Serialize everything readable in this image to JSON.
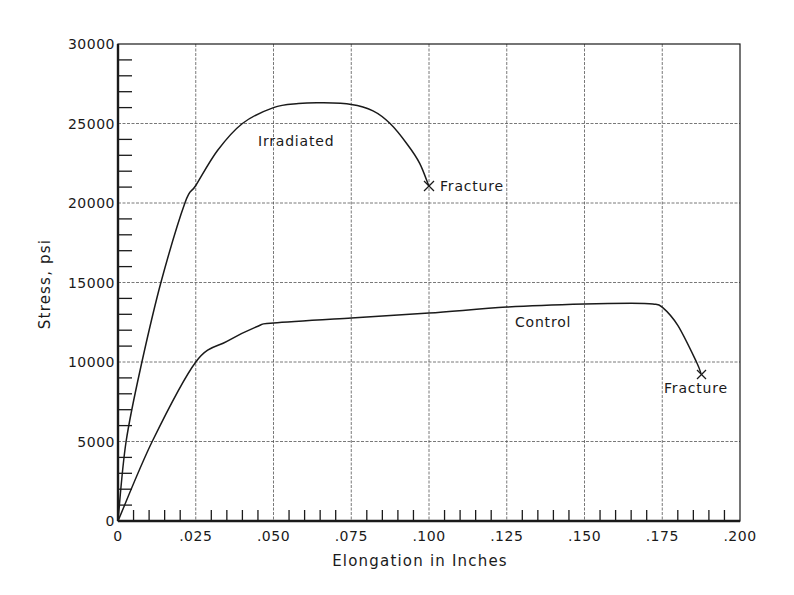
{
  "chart_data": {
    "type": "line",
    "title": "",
    "xlabel": "Elongation in Inches",
    "ylabel": "Stress, psi",
    "xlim": [
      0,
      0.2
    ],
    "ylim": [
      0,
      30000
    ],
    "grid": true,
    "legend": "none (curves labeled inline)",
    "x_ticks": [
      0,
      0.025,
      0.05,
      0.075,
      0.1,
      0.125,
      0.15,
      0.175,
      0.2
    ],
    "x_tick_labels": [
      "0",
      ".025",
      ".050",
      ".075",
      ".100",
      ".125",
      ".150",
      ".175",
      ".200"
    ],
    "y_ticks": [
      0,
      5000,
      10000,
      15000,
      20000,
      25000,
      30000
    ],
    "y_tick_labels": [
      "0",
      "5000",
      "10000",
      "15000",
      "20000",
      "25000",
      "30000"
    ],
    "series": [
      {
        "name": "Irradiated",
        "x": [
          0,
          0.0026,
          0.0077,
          0.0138,
          0.0215,
          0.025,
          0.032,
          0.04,
          0.05,
          0.058,
          0.065,
          0.075,
          0.082,
          0.0875,
          0.093,
          0.097,
          0.1
        ],
        "y": [
          0,
          5000,
          10000,
          15000,
          20000,
          21100,
          23300,
          25000,
          26000,
          26250,
          26300,
          26200,
          25800,
          25000,
          23700,
          22500,
          21050
        ]
      },
      {
        "name": "Control",
        "x": [
          0,
          0.011,
          0.025,
          0.035,
          0.045,
          0.05,
          0.075,
          0.1,
          0.125,
          0.15,
          0.165,
          0.172,
          0.175,
          0.18,
          0.186,
          0.1875
        ],
        "y": [
          0,
          5000,
          10000,
          11300,
          12250,
          12450,
          12770,
          13080,
          13450,
          13650,
          13700,
          13650,
          13450,
          12300,
          10000,
          9250
        ]
      }
    ],
    "annotations": [
      {
        "text": "Irradiated",
        "x": 0.072,
        "y": 24000
      },
      {
        "text": "Fracture",
        "x": 0.1,
        "y": 21050,
        "marker": "x"
      },
      {
        "text": "Control",
        "x": 0.134,
        "y": 12200
      },
      {
        "text": "Fracture",
        "x": 0.1875,
        "y": 9250,
        "marker": "x"
      }
    ]
  },
  "labels": {
    "xlabel": "Elongation in Inches",
    "ylabel": "Stress, psi",
    "irradiated": "Irradiated",
    "control": "Control",
    "fracture_irradiated": "Fracture",
    "fracture_control": "Fracture"
  }
}
